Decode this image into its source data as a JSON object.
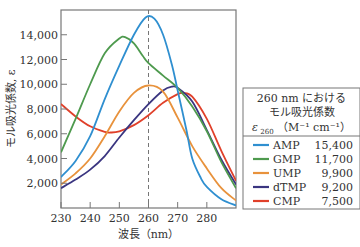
{
  "chart_data": {
    "type": "line",
    "title": "",
    "xlabel": "波長（nm）",
    "ylabel": "モル吸光係数, ε",
    "xlim": [
      230,
      290
    ],
    "ylim": [
      0,
      16000
    ],
    "x_ticks": [
      230,
      240,
      250,
      260,
      270,
      280
    ],
    "x_tick_labels": [
      "230",
      "240",
      "250",
      "260",
      "270",
      "280"
    ],
    "y_ticks": [
      2000,
      4000,
      6000,
      8000,
      10000,
      12000,
      14000
    ],
    "y_tick_labels": [
      "2,000",
      "4,000",
      "6,000",
      "8,000",
      "10,000",
      "12,000",
      "14,000"
    ],
    "grid": false,
    "reference_line": {
      "x": 260,
      "style": "dashed"
    },
    "legend": {
      "placement": "right",
      "header_lines": [
        "260 nm における",
        "モル吸光係数",
        "ε 260 （M⁻¹ cm⁻¹）"
      ],
      "header_eps_symbol": "ε",
      "header_eps_sub": "260",
      "header_units": "（M⁻¹ cm⁻¹）"
    },
    "series": [
      {
        "name": "AMP",
        "color": "#2f8fd0",
        "epsilon_260": "15,400",
        "x": [
          230,
          235,
          240,
          245,
          250,
          255,
          259,
          262,
          265,
          268,
          270,
          273,
          275,
          278,
          280,
          285,
          290
        ],
        "y": [
          2500,
          3800,
          5800,
          8800,
          11500,
          14000,
          15400,
          15300,
          14000,
          11600,
          9500,
          6300,
          4000,
          2400,
          1700,
          700,
          200
        ]
      },
      {
        "name": "GMP",
        "color": "#4e9a4e",
        "epsilon_260": "11,700",
        "x": [
          230,
          235,
          240,
          245,
          250,
          252,
          255,
          258,
          260,
          265,
          270,
          275,
          280,
          285,
          290
        ],
        "y": [
          4500,
          7200,
          10000,
          12500,
          13700,
          13800,
          13300,
          12300,
          11700,
          10700,
          9700,
          8200,
          6200,
          3700,
          1600
        ]
      },
      {
        "name": "UMP",
        "color": "#e8923c",
        "epsilon_260": "9,900",
        "x": [
          230,
          235,
          240,
          245,
          250,
          255,
          260,
          265,
          270,
          275,
          280,
          285,
          290
        ],
        "y": [
          1900,
          2800,
          4000,
          5800,
          7800,
          9300,
          9900,
          9400,
          7300,
          5000,
          3200,
          1600,
          600
        ]
      },
      {
        "name": "dTMP",
        "color": "#3a3580",
        "epsilon_260": "9,200",
        "x": [
          230,
          235,
          240,
          245,
          250,
          255,
          260,
          265,
          268,
          270,
          275,
          280,
          285,
          290
        ],
        "y": [
          1600,
          2300,
          3100,
          4200,
          5700,
          7100,
          8400,
          9500,
          9800,
          9700,
          8600,
          6300,
          3900,
          1900
        ]
      },
      {
        "name": "CMP",
        "color": "#e0402a",
        "epsilon_260": "7,500",
        "x": [
          230,
          235,
          240,
          245,
          247,
          250,
          255,
          260,
          265,
          270,
          272,
          275,
          280,
          285,
          290
        ],
        "y": [
          8400,
          7400,
          6600,
          6150,
          6100,
          6200,
          6700,
          7500,
          8500,
          9200,
          9300,
          9000,
          7200,
          4600,
          2200
        ]
      }
    ]
  }
}
